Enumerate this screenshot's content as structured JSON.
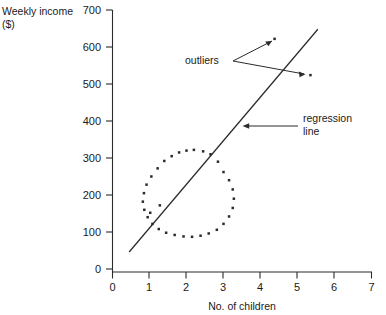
{
  "chart_data": {
    "type": "scatter",
    "title": "",
    "xlabel": "No. of children",
    "ylabel": "Weekly income ($)",
    "ylabel_line1": "Weekly income",
    "ylabel_line2": "($)",
    "xlim": [
      0,
      7
    ],
    "ylim": [
      0,
      700
    ],
    "xticks": [
      "0",
      "1",
      "2",
      "3",
      "4",
      "5",
      "6",
      "7"
    ],
    "xtick_values": [
      0,
      1,
      2,
      3,
      4,
      5,
      6,
      7
    ],
    "yticks": [
      "0",
      "100",
      "200",
      "300",
      "400",
      "500",
      "600",
      "700"
    ],
    "ytick_values": [
      0,
      100,
      200,
      300,
      400,
      500,
      600,
      700
    ],
    "grid": false,
    "legend": "none",
    "marker": "dot",
    "marker_color": "#2b2b2b",
    "axis_color": "#2b2b2b",
    "background": "#ffffff",
    "series": [
      {
        "name": "observations",
        "comment": "points arranged in a ring (donut) cluster plus two interior points",
        "points": [
          [
            2.0,
            320
          ],
          [
            2.2,
            322
          ],
          [
            2.45,
            318
          ],
          [
            2.65,
            310
          ],
          [
            1.8,
            315
          ],
          [
            1.6,
            305
          ],
          [
            1.4,
            292
          ],
          [
            1.22,
            272
          ],
          [
            1.05,
            250
          ],
          [
            0.92,
            228
          ],
          [
            0.85,
            205
          ],
          [
            0.82,
            182
          ],
          [
            0.86,
            160
          ],
          [
            0.95,
            140
          ],
          [
            1.08,
            122
          ],
          [
            1.25,
            108
          ],
          [
            1.45,
            98
          ],
          [
            1.68,
            92
          ],
          [
            1.92,
            88
          ],
          [
            2.15,
            87
          ],
          [
            2.38,
            90
          ],
          [
            2.6,
            96
          ],
          [
            2.82,
            106
          ],
          [
            3.0,
            122
          ],
          [
            3.15,
            142
          ],
          [
            3.25,
            165
          ],
          [
            3.28,
            190
          ],
          [
            3.25,
            215
          ],
          [
            3.15,
            240
          ],
          [
            3.0,
            262
          ],
          [
            2.85,
            290
          ],
          [
            1.28,
            172
          ],
          [
            1.02,
            152
          ]
        ]
      },
      {
        "name": "outliers",
        "points": [
          [
            4.38,
            622
          ],
          [
            5.35,
            524
          ]
        ]
      }
    ],
    "regression_line": {
      "label": "regression line",
      "label_line1": "regression",
      "label_line2": "line",
      "x_start": 0.45,
      "y_start": 46,
      "x_end": 5.55,
      "y_end": 648
    },
    "annotations": [
      {
        "name": "outliers",
        "text": "outliers",
        "points_to": [
          "outlier-1",
          "outlier-2"
        ]
      },
      {
        "name": "regression-line",
        "text": "regression line",
        "points_to": [
          "regression-line"
        ]
      }
    ]
  },
  "labels": {
    "outliers": "outliers",
    "regression_line1": "regression",
    "regression_line2": "line",
    "y_axis_line1": "Weekly income",
    "y_axis_line2": "($)",
    "x_axis_title": "No. of children"
  }
}
